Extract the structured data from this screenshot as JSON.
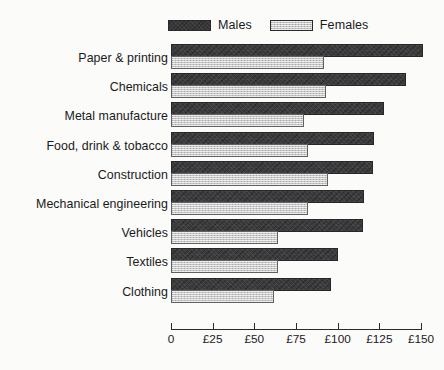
{
  "legend": {
    "entries": [
      {
        "label": "Males",
        "swatch": "male-swatch",
        "color": "#3a3a3c"
      },
      {
        "label": "Females",
        "swatch": "female-swatch",
        "color": "#c6c6c6"
      }
    ]
  },
  "axis": {
    "ticks": [
      "0",
      "£25",
      "£50",
      "£75",
      "£100",
      "£125",
      "£150"
    ],
    "tick_values": [
      0,
      25,
      50,
      75,
      100,
      125,
      150
    ]
  },
  "chart_data": {
    "type": "bar",
    "orientation": "horizontal",
    "title": "",
    "xlabel": "",
    "ylabel": "",
    "xlim": [
      0,
      150
    ],
    "grid": false,
    "legend_position": "top",
    "categories": [
      "Paper & printing",
      "Chemicals",
      "Metal manufacture",
      "Food, drink & tobacco",
      "Construction",
      "Mechanical engineering",
      "Vehicles",
      "Textiles",
      "Clothing"
    ],
    "tick_labels": [
      "0",
      "£25",
      "£50",
      "£75",
      "£100",
      "£125",
      "£150"
    ],
    "series": [
      {
        "name": "Males",
        "color": "#3a3a3c",
        "values": [
          151,
          141,
          128,
          122,
          121,
          116,
          115,
          100,
          96
        ]
      },
      {
        "name": "Females",
        "color": "#c6c6c6",
        "values": [
          92,
          93,
          80,
          82,
          94,
          82,
          64,
          64,
          62
        ]
      }
    ]
  }
}
